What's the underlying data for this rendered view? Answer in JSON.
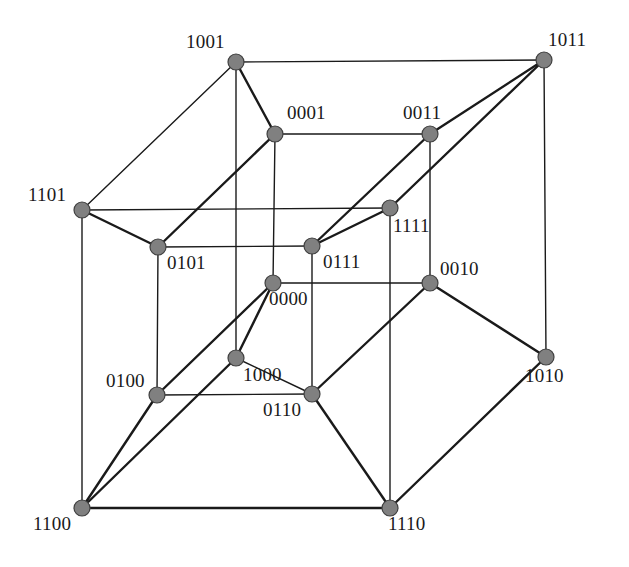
{
  "figure": {
    "kind": "graph-diagram",
    "name": "tesseract-graph",
    "width": 629,
    "height": 567,
    "background_color": "#ffffff",
    "node_fill_color": "#808080",
    "node_stroke_color": "#404040",
    "edge_color": "#1a1a1a",
    "label_color": "#1a1a1a",
    "node_radius": 8,
    "node_count": 16,
    "edge_count": 32
  },
  "nodes": [
    {
      "id": "1001",
      "label": "1001",
      "x": 236,
      "y": 62,
      "label_x": 186,
      "label_y": 32,
      "anchor": "left"
    },
    {
      "id": "1011",
      "label": "1011",
      "x": 544,
      "y": 60,
      "label_x": 548,
      "label_y": 30,
      "anchor": "left"
    },
    {
      "id": "0001",
      "label": "0001",
      "x": 275,
      "y": 134,
      "label_x": 287,
      "label_y": 103,
      "anchor": "left"
    },
    {
      "id": "0011",
      "label": "0011",
      "x": 430,
      "y": 134,
      "label_x": 403,
      "label_y": 103,
      "anchor": "left"
    },
    {
      "id": "1101",
      "label": "1101",
      "x": 82,
      "y": 210,
      "label_x": 28,
      "label_y": 185,
      "anchor": "left"
    },
    {
      "id": "1111",
      "label": "1111",
      "x": 390,
      "y": 208,
      "label_x": 393,
      "label_y": 216,
      "anchor": "left"
    },
    {
      "id": "0101",
      "label": "0101",
      "x": 158,
      "y": 247,
      "label_x": 167,
      "label_y": 253,
      "anchor": "left"
    },
    {
      "id": "0111",
      "label": "0111",
      "x": 312,
      "y": 246,
      "label_x": 323,
      "label_y": 252,
      "anchor": "left"
    },
    {
      "id": "0010",
      "label": "0010",
      "x": 430,
      "y": 283,
      "label_x": 440,
      "label_y": 259,
      "anchor": "left"
    },
    {
      "id": "0000",
      "label": "0000",
      "x": 273,
      "y": 283,
      "label_x": 269,
      "label_y": 289,
      "anchor": "left"
    },
    {
      "id": "1010",
      "label": "1010",
      "x": 546,
      "y": 357,
      "label_x": 525,
      "label_y": 366,
      "anchor": "left"
    },
    {
      "id": "1000",
      "label": "1000",
      "x": 236,
      "y": 358,
      "label_x": 243,
      "label_y": 365,
      "anchor": "left"
    },
    {
      "id": "0100",
      "label": "0100",
      "x": 157,
      "y": 395,
      "label_x": 106,
      "label_y": 371,
      "anchor": "left"
    },
    {
      "id": "0110",
      "label": "0110",
      "x": 312,
      "y": 394,
      "label_x": 263,
      "label_y": 400,
      "anchor": "left"
    },
    {
      "id": "1100",
      "label": "1100",
      "x": 82,
      "y": 508,
      "label_x": 33,
      "label_y": 514,
      "anchor": "left"
    },
    {
      "id": "1110",
      "label": "1110",
      "x": 390,
      "y": 508,
      "label_x": 388,
      "label_y": 514,
      "anchor": "left"
    }
  ],
  "edges": [
    {
      "from": "1001",
      "to": "1011",
      "weight": "thin"
    },
    {
      "from": "1001",
      "to": "1101",
      "weight": "thin"
    },
    {
      "from": "1001",
      "to": "0001",
      "weight": "thick"
    },
    {
      "from": "1001",
      "to": "1000",
      "weight": "thin"
    },
    {
      "from": "1011",
      "to": "0011",
      "weight": "thick"
    },
    {
      "from": "1011",
      "to": "1111",
      "weight": "thick"
    },
    {
      "from": "1011",
      "to": "1010",
      "weight": "thin"
    },
    {
      "from": "0001",
      "to": "0011",
      "weight": "thin"
    },
    {
      "from": "0001",
      "to": "0101",
      "weight": "thick"
    },
    {
      "from": "0001",
      "to": "0000",
      "weight": "thin"
    },
    {
      "from": "0011",
      "to": "0111",
      "weight": "thick"
    },
    {
      "from": "0011",
      "to": "0010",
      "weight": "thin"
    },
    {
      "from": "1101",
      "to": "1111",
      "weight": "thin"
    },
    {
      "from": "1101",
      "to": "0101",
      "weight": "thick"
    },
    {
      "from": "1101",
      "to": "1100",
      "weight": "thin"
    },
    {
      "from": "1111",
      "to": "0111",
      "weight": "thick"
    },
    {
      "from": "1111",
      "to": "1110",
      "weight": "thin"
    },
    {
      "from": "0101",
      "to": "0111",
      "weight": "thin"
    },
    {
      "from": "0101",
      "to": "0100",
      "weight": "thin"
    },
    {
      "from": "0111",
      "to": "0110",
      "weight": "thin"
    },
    {
      "from": "0010",
      "to": "0000",
      "weight": "thin"
    },
    {
      "from": "0010",
      "to": "1010",
      "weight": "thick"
    },
    {
      "from": "0010",
      "to": "0110",
      "weight": "thick"
    },
    {
      "from": "0000",
      "to": "1000",
      "weight": "thick"
    },
    {
      "from": "0000",
      "to": "0100",
      "weight": "thick"
    },
    {
      "from": "1010",
      "to": "1110",
      "weight": "thick"
    },
    {
      "from": "1000",
      "to": "1100",
      "weight": "thick"
    },
    {
      "from": "1000",
      "to": "0110",
      "weight": "thin"
    },
    {
      "from": "0100",
      "to": "1100",
      "weight": "thick"
    },
    {
      "from": "0100",
      "to": "0110",
      "weight": "thin"
    },
    {
      "from": "1100",
      "to": "1110",
      "weight": "thick"
    },
    {
      "from": "0110",
      "to": "1110",
      "weight": "thick"
    }
  ]
}
